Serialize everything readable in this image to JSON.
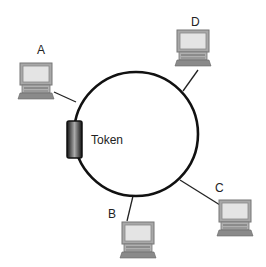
{
  "diagram": {
    "type": "token-ring-network",
    "token_label": "Token",
    "nodes": [
      {
        "id": "A",
        "label": "A"
      },
      {
        "id": "B",
        "label": "B"
      },
      {
        "id": "C",
        "label": "C"
      },
      {
        "id": "D",
        "label": "D"
      }
    ],
    "colors": {
      "ring": "#111111",
      "computer_body": "#9a9a9a",
      "screen": "#e2e2e2"
    }
  }
}
